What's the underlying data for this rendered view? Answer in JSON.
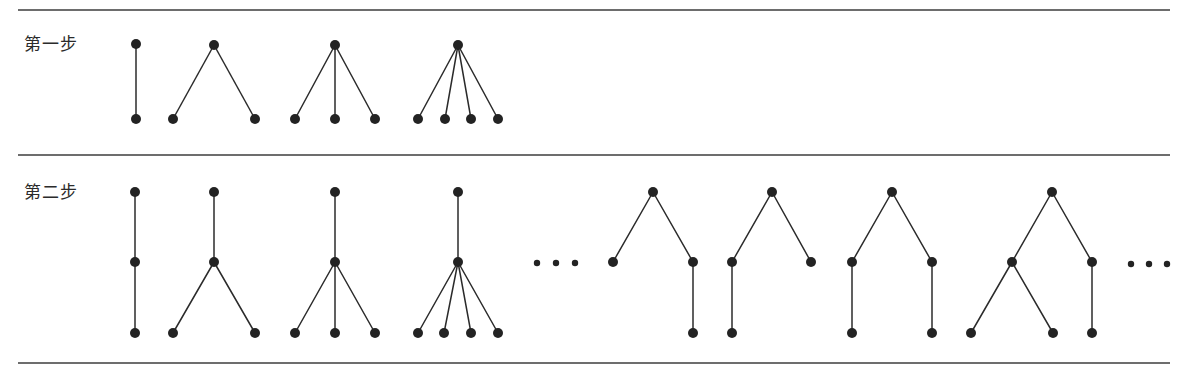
{
  "figure": {
    "width": 1197,
    "height": 379,
    "background": "#ffffff",
    "node_color": "#232323",
    "edge_color": "#2b2b2b",
    "rule_color": "#3c3c3c",
    "node_radius": 5
  },
  "rules": [
    {
      "name": "top-rule",
      "x1": 18,
      "y1": 10,
      "x2": 1170,
      "y2": 10
    },
    {
      "name": "middle-rule",
      "x1": 18,
      "y1": 155,
      "x2": 1170,
      "y2": 155
    },
    {
      "name": "bottom-rule",
      "x1": 18,
      "y1": 363,
      "x2": 1170,
      "y2": 363
    }
  ],
  "rows": [
    {
      "id": "row1",
      "label": "第一步",
      "label_text": "第一步"
    },
    {
      "id": "row2",
      "label": "第二步",
      "label_text": "第二步"
    }
  ],
  "row1": {
    "label": "第一步",
    "trees": [
      {
        "name": "tree-1-1",
        "description": "root with 1 child",
        "nodes": [
          [
            136,
            44
          ],
          [
            136,
            119
          ]
        ],
        "edges": [
          [
            0,
            1
          ]
        ]
      },
      {
        "name": "tree-1-2",
        "description": "root with 2 children",
        "nodes": [
          [
            214,
            45
          ],
          [
            173,
            119
          ],
          [
            255,
            119
          ]
        ],
        "edges": [
          [
            0,
            1
          ],
          [
            0,
            2
          ]
        ]
      },
      {
        "name": "tree-1-3",
        "description": "root with 3 children",
        "nodes": [
          [
            335,
            45
          ],
          [
            295,
            119
          ],
          [
            335,
            119
          ],
          [
            375,
            119
          ]
        ],
        "edges": [
          [
            0,
            1
          ],
          [
            0,
            2
          ],
          [
            0,
            3
          ]
        ]
      },
      {
        "name": "tree-1-4",
        "description": "root with 4 children",
        "nodes": [
          [
            458,
            45
          ],
          [
            418,
            119
          ],
          [
            445,
            119
          ],
          [
            471,
            119
          ],
          [
            498,
            119
          ]
        ],
        "edges": [
          [
            0,
            1
          ],
          [
            0,
            2
          ],
          [
            0,
            3
          ],
          [
            0,
            4
          ]
        ]
      }
    ],
    "ellipses": []
  },
  "row2": {
    "label": "第二步",
    "trees": [
      {
        "name": "tree-2-1",
        "description": "path of 3 nodes",
        "nodes": [
          [
            135,
            192
          ],
          [
            135,
            262
          ],
          [
            135,
            333
          ]
        ],
        "edges": [
          [
            0,
            1
          ],
          [
            1,
            2
          ]
        ]
      },
      {
        "name": "tree-2-2",
        "description": "root - child with 2 children",
        "nodes": [
          [
            214,
            192
          ],
          [
            214,
            262
          ],
          [
            173,
            333
          ],
          [
            255,
            333
          ]
        ],
        "edges": [
          [
            0,
            1
          ],
          [
            1,
            2
          ],
          [
            1,
            3
          ]
        ]
      },
      {
        "name": "tree-2-3",
        "description": "root - child with 3 children",
        "nodes": [
          [
            335,
            192
          ],
          [
            335,
            262
          ],
          [
            295,
            333
          ],
          [
            335,
            333
          ],
          [
            375,
            333
          ]
        ],
        "edges": [
          [
            0,
            1
          ],
          [
            1,
            2
          ],
          [
            1,
            3
          ],
          [
            1,
            4
          ]
        ]
      },
      {
        "name": "tree-2-4",
        "description": "root - child with 4 children",
        "nodes": [
          [
            458,
            192
          ],
          [
            458,
            262
          ],
          [
            418,
            333
          ],
          [
            444,
            333
          ],
          [
            471,
            333
          ],
          [
            498,
            333
          ]
        ],
        "edges": [
          [
            0,
            1
          ],
          [
            1,
            2
          ],
          [
            1,
            3
          ],
          [
            1,
            4
          ],
          [
            1,
            5
          ]
        ]
      },
      {
        "name": "tree-2-5",
        "description": "root with 2 children, right child has 1 child",
        "nodes": [
          [
            653,
            192
          ],
          [
            613,
            262
          ],
          [
            693,
            262
          ],
          [
            693,
            333
          ]
        ],
        "edges": [
          [
            0,
            1
          ],
          [
            0,
            2
          ],
          [
            2,
            3
          ]
        ]
      },
      {
        "name": "tree-2-6",
        "description": "root with 2 children, left child has 1 child",
        "nodes": [
          [
            772,
            192
          ],
          [
            732,
            262
          ],
          [
            811,
            262
          ],
          [
            732,
            333
          ]
        ],
        "edges": [
          [
            0,
            1
          ],
          [
            0,
            2
          ],
          [
            1,
            3
          ]
        ]
      },
      {
        "name": "tree-2-7",
        "description": "root with 2 children, each has 1 child",
        "nodes": [
          [
            892,
            192
          ],
          [
            852,
            262
          ],
          [
            932,
            262
          ],
          [
            852,
            333
          ],
          [
            932,
            333
          ]
        ],
        "edges": [
          [
            0,
            1
          ],
          [
            0,
            2
          ],
          [
            1,
            3
          ],
          [
            2,
            4
          ]
        ]
      },
      {
        "name": "tree-2-8",
        "description": "root with 2 children, left child has 2 children, right child has 1 child",
        "nodes": [
          [
            1052,
            192
          ],
          [
            1012,
            262
          ],
          [
            1092,
            262
          ],
          [
            971,
            333
          ],
          [
            1053,
            333
          ],
          [
            1092,
            333
          ]
        ],
        "edges": [
          [
            0,
            1
          ],
          [
            0,
            2
          ],
          [
            1,
            3
          ],
          [
            1,
            4
          ],
          [
            2,
            5
          ]
        ]
      }
    ],
    "ellipses": [
      {
        "name": "ellipsis-middle",
        "cx": [
          537,
          556,
          575
        ],
        "cy": 263,
        "r": 3.2
      },
      {
        "name": "ellipsis-right",
        "cx": [
          1131,
          1149,
          1167
        ],
        "cy": 264,
        "r": 3.2
      }
    ]
  }
}
